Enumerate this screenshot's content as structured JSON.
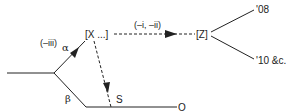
{
  "diagram": {
    "nodes": {
      "x": "[X ...]",
      "z": "[Z]",
      "s": "S",
      "o": "O",
      "y08": "'08",
      "y10": "'10 &c."
    },
    "labels": {
      "alpha": "α",
      "beta": "β",
      "alpha_annot": "(–iii)",
      "xz_annot": "(–i, –ii)"
    },
    "edges": [
      {
        "from": "start",
        "to": "split",
        "style": "solid"
      },
      {
        "from": "split",
        "to": "X",
        "style": "solid",
        "arrow": true,
        "label": "α",
        "annotation": "(–iii)"
      },
      {
        "from": "split",
        "to": "O",
        "style": "solid",
        "label": "β"
      },
      {
        "from": "X",
        "to": "S",
        "style": "dashed",
        "arrow": true
      },
      {
        "from": "X",
        "to": "Z",
        "style": "dashed",
        "arrow": true,
        "annotation": "(–i, –ii)"
      },
      {
        "from": "Z",
        "to": "'08",
        "style": "solid"
      },
      {
        "from": "Z",
        "to": "'10 &c.",
        "style": "solid"
      }
    ],
    "colors": {
      "ink": "#222222",
      "background": "#ffffff"
    }
  }
}
